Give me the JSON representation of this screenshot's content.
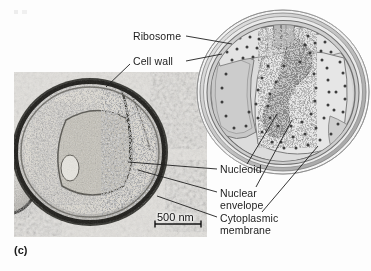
{
  "figure": {
    "panel_label": "(c)",
    "kind": "electron-micrograph-with-schematic-diagram",
    "background_color": "#fdfdfd",
    "text_color": "#1c1c1c"
  },
  "labels": {
    "ribosome": "Ribosome",
    "cell_wall": "Cell wall",
    "nucleoid": "Nucleoid",
    "nuclear_envelope_line1": "Nuclear",
    "nuclear_envelope_line2": "envelope",
    "cytoplasmic_membrane_line1": "Cytoplasmic",
    "cytoplasmic_membrane_line2": "membrane"
  },
  "scale_bar": {
    "value": "500 nm",
    "length_px": 46
  },
  "micrograph": {
    "name": "transmission-electron-micrograph",
    "x": 14,
    "y": 72,
    "width": 193,
    "height": 165,
    "tone_light": "#e6e4e0",
    "tone_mid": "#9a978f",
    "tone_dark": "#2b2a28"
  },
  "diagram": {
    "name": "schematic-cell-diagram",
    "cx": 283,
    "cy": 92,
    "rx": 86,
    "ry": 82,
    "wall_color": "#c9c9c9",
    "membrane_color": "#8f8f8f",
    "cytoplasm_color": "#dedede",
    "nucleoid_color": "#6b6b6b",
    "ribosome_dot_color": "#4a4a4a",
    "ribosome_dot_count": 120
  }
}
